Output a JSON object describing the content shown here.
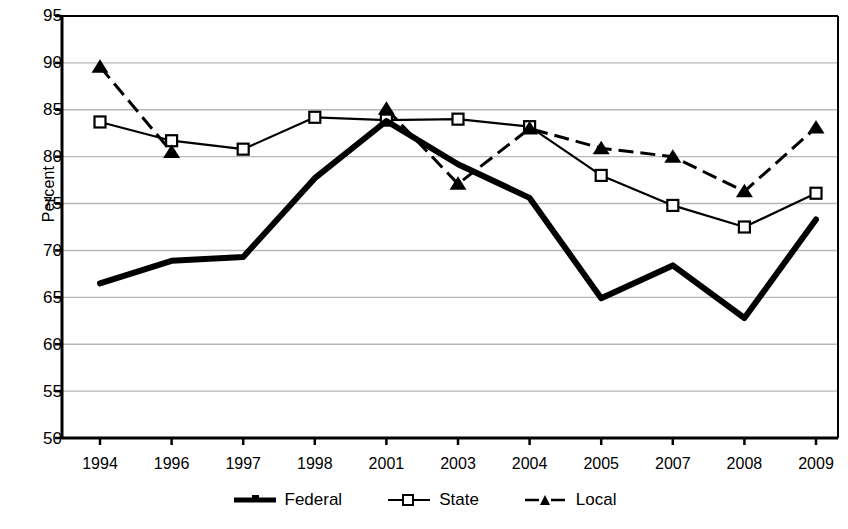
{
  "chart_data": {
    "type": "line",
    "title": "",
    "xlabel": "",
    "ylabel": "Percent",
    "categories": [
      "1994",
      "1996",
      "1997",
      "1998",
      "2001",
      "2003",
      "2004",
      "2005",
      "2007",
      "2008",
      "2009"
    ],
    "ylim": [
      50,
      95
    ],
    "yticks": [
      50,
      55,
      60,
      65,
      70,
      75,
      80,
      85,
      90,
      95
    ],
    "grid": true,
    "legend_position": "bottom",
    "series": [
      {
        "name": "Federal",
        "style": "thick-solid",
        "marker": "none",
        "color": "#000000",
        "values": [
          66.5,
          68.9,
          69.3,
          77.7,
          83.8,
          79.2,
          75.6,
          64.9,
          68.4,
          62.8,
          73.3
        ]
      },
      {
        "name": "State",
        "style": "thin-solid",
        "marker": "open-square",
        "color": "#000000",
        "values": [
          83.7,
          81.7,
          80.8,
          84.2,
          83.9,
          84.0,
          83.2,
          78.0,
          74.8,
          72.5,
          76.1
        ]
      },
      {
        "name": "Local",
        "style": "dashed",
        "marker": "filled-triangle",
        "color": "#000000",
        "values": [
          89.6,
          80.5,
          null,
          null,
          85.1,
          77.1,
          83.0,
          80.9,
          80.0,
          76.3,
          83.1
        ]
      }
    ]
  },
  "axis": {
    "y_title": "Percent",
    "y_tick_labels": [
      "95",
      "90",
      "85",
      "80",
      "75",
      "70",
      "65",
      "60",
      "55",
      "50"
    ],
    "x_tick_labels": [
      "1994",
      "1996",
      "1997",
      "1998",
      "2001",
      "2003",
      "2004",
      "2005",
      "2007",
      "2008",
      "2009"
    ]
  },
  "legend": {
    "items": [
      {
        "label": "Federal",
        "swatch": "thick-line-swatch"
      },
      {
        "label": "State",
        "swatch": "square-marker-line-swatch"
      },
      {
        "label": "Local",
        "swatch": "dashed-triangle-line-swatch"
      }
    ]
  },
  "colors": {
    "line": "#000000",
    "grid": "#b7b7b7",
    "axis": "#000000",
    "background": "#ffffff"
  }
}
